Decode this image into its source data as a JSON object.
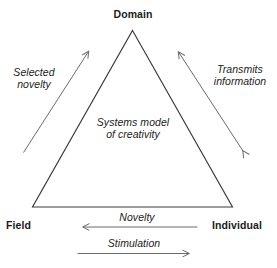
{
  "figure": {
    "type": "triangle-diagram",
    "title_internal": "Systems model of creativity",
    "background_color": "#ffffff",
    "line_color": "#3a3a3a",
    "arrow_color": "#6b6b6b",
    "text_color": "#1b1b1b",
    "vertices": [
      {
        "id": "domain",
        "label": "Domain",
        "position": "top"
      },
      {
        "id": "field",
        "label": "Field",
        "position": "bottom-left"
      },
      {
        "id": "individual",
        "label": "Individual",
        "position": "bottom-right"
      }
    ],
    "center_text": {
      "line1": "Systems model",
      "line2": "of creativity"
    },
    "flows": [
      {
        "id": "selected-novelty",
        "line1": "Selected",
        "line2": "novelty",
        "from": "field",
        "to": "domain",
        "direction": "single",
        "side": "left"
      },
      {
        "id": "transmits-information",
        "line1": "Transmits",
        "line2": "information",
        "from": "domain",
        "to": "individual",
        "direction": "double",
        "side": "right"
      },
      {
        "id": "novelty",
        "line1": "Novelty",
        "from": "individual",
        "to": "field",
        "direction": "single",
        "side": "bottom-upper"
      },
      {
        "id": "stimulation",
        "line1": "Stimulation",
        "from": "field",
        "to": "individual",
        "direction": "single",
        "side": "bottom-lower"
      }
    ]
  }
}
